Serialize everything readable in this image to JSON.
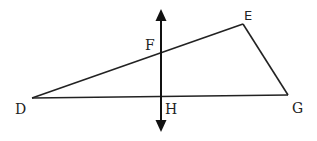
{
  "diagram": {
    "type": "geometry-triangle-with-perpendicular-line",
    "stroke_color": "#222222",
    "points": {
      "D": {
        "label": "D",
        "x": 32,
        "y": 98
      },
      "E": {
        "label": "E",
        "x": 243,
        "y": 24
      },
      "G": {
        "label": "G",
        "x": 288,
        "y": 95
      },
      "F": {
        "label": "F",
        "x": 161,
        "y": 52
      },
      "H": {
        "label": "H",
        "x": 161,
        "y": 97
      }
    },
    "segments": [
      {
        "from": "D",
        "to": "E"
      },
      {
        "from": "E",
        "to": "G"
      },
      {
        "from": "G",
        "to": "D"
      }
    ],
    "line": {
      "name": "vertical line through F and H",
      "double_arrow": true,
      "x": 161,
      "y_top": 10,
      "y_bottom": 131
    }
  },
  "labels": {
    "D": "D",
    "E": "E",
    "F": "F",
    "G": "G",
    "H": "H"
  }
}
